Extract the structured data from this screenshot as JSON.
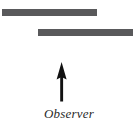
{
  "diagram": {
    "background_color": "#ffffff",
    "bar_color": "#59595b",
    "arrow_color": "#111111",
    "label_color": "#2a2a2a",
    "elements": {
      "upper_bar": {
        "name": "upper horizontal bar",
        "x": 2,
        "y": 9,
        "width": 95,
        "height": 7
      },
      "lower_bar": {
        "name": "lower horizontal bar",
        "x": 38,
        "y": 29,
        "width": 95,
        "height": 7
      },
      "arrow": {
        "name": "upward pointing arrow",
        "direction": "up",
        "x": 50,
        "y": 61,
        "width": 24,
        "height": 42
      }
    },
    "labels": {
      "observer": "Observer"
    }
  }
}
